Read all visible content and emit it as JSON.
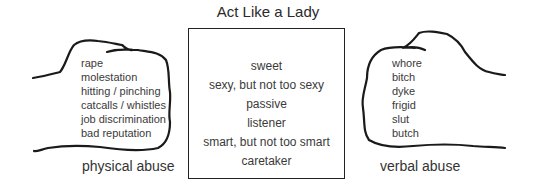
{
  "title": "Act Like a Lady",
  "box_items": [
    "sweet",
    "sexy, but not too sexy",
    "passive",
    "listener",
    "smart, but not too smart",
    "caretaker"
  ],
  "left_fist": {
    "caption": "physical abuse",
    "items": [
      "rape",
      "molestation",
      "hitting / pinching",
      "catcalls / whistles",
      "job discrimination",
      "bad reputation"
    ]
  },
  "right_fist": {
    "caption": "verbal abuse",
    "items": [
      "whore",
      "bitch",
      "dyke",
      "frigid",
      "slut",
      "butch"
    ]
  },
  "colors": {
    "line": "#1a1a1a",
    "text": "#3a3a3a"
  }
}
